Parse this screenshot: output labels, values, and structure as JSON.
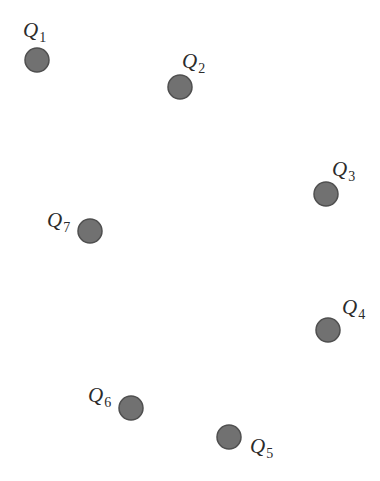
{
  "diagram": {
    "type": "point-layout",
    "node_style": {
      "fill": "#717171",
      "stroke": "#4f4f4f",
      "radius": 12
    },
    "label_color": "#2b2b2b",
    "nodes": [
      {
        "id": "Q1",
        "letter": "Q",
        "sub": "1",
        "cx": 37,
        "cy": 60,
        "lx": 23,
        "ly": 37
      },
      {
        "id": "Q2",
        "letter": "Q",
        "sub": "2",
        "cx": 180,
        "cy": 87,
        "lx": 182,
        "ly": 68
      },
      {
        "id": "Q3",
        "letter": "Q",
        "sub": "3",
        "cx": 326,
        "cy": 194,
        "lx": 332,
        "ly": 176
      },
      {
        "id": "Q4",
        "letter": "Q",
        "sub": "4",
        "cx": 328,
        "cy": 330,
        "lx": 342,
        "ly": 314
      },
      {
        "id": "Q5",
        "letter": "Q",
        "sub": "5",
        "cx": 229,
        "cy": 437,
        "lx": 250,
        "ly": 453
      },
      {
        "id": "Q6",
        "letter": "Q",
        "sub": "6",
        "cx": 131,
        "cy": 408,
        "lx": 88,
        "ly": 402
      },
      {
        "id": "Q7",
        "letter": "Q",
        "sub": "7",
        "cx": 90,
        "cy": 231,
        "lx": 47,
        "ly": 227
      }
    ]
  }
}
